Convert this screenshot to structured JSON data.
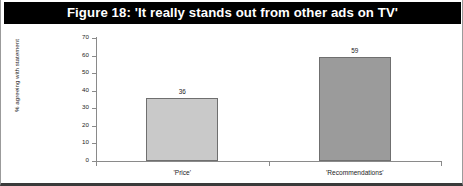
{
  "figure": {
    "title": "Figure 18: 'It really stands out from other ads on TV'",
    "title_band_color": "#000000",
    "title_text_color": "#ffffff",
    "frame_border_color": "#9b9b9b",
    "baseline_color": "#3a3a3a"
  },
  "chart_data": {
    "type": "bar",
    "title": "Figure 18: 'It really stands out from other ads on TV'",
    "categories": [
      "'Price'",
      "'Recommendations'"
    ],
    "values": [
      36,
      59
    ],
    "data_labels": [
      "36",
      "59"
    ],
    "xlabel": "",
    "ylabel": "% agreeing with statement",
    "ylim": [
      0,
      70
    ],
    "ytick_step": 10,
    "ytick_labels": [
      "0",
      "10",
      "20",
      "30",
      "40",
      "50",
      "60",
      "70"
    ],
    "grid": false,
    "legend": null,
    "series_colors": [
      "#c9c9c9",
      "#9b9b9b"
    ],
    "bar_border_color": "#6f6f6f"
  }
}
